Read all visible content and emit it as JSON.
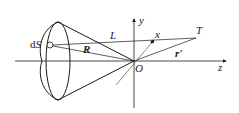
{
  "diagram": {
    "labels": {
      "dS_prefix": "d",
      "dS_var": "S",
      "R": "R",
      "L": "L",
      "x": "x",
      "y": "y",
      "T": "T",
      "r_prime": "r'",
      "O": "O",
      "z": "z"
    },
    "colors": {
      "stroke": "#1a1a1a",
      "thin_stroke": "#555555",
      "background": "#ffffff"
    }
  }
}
